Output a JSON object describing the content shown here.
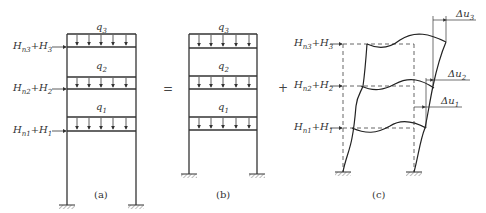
{
  "figure": {
    "panels": [
      {
        "id": "a",
        "caption": "(a)",
        "loads_vertical": [
          "q3",
          "q2",
          "q1"
        ],
        "loads_horizontal": [
          {
            "label": "Hn3+H3",
            "main": "H",
            "sub1": "n3",
            "plus": "+H",
            "sub2": "3"
          },
          {
            "label": "Hn2+H2",
            "main": "H",
            "sub1": "n2",
            "plus": "+H",
            "sub2": "2"
          },
          {
            "label": "Hn1+H1",
            "main": "H",
            "sub1": "n1",
            "plus": "+H",
            "sub2": "1"
          }
        ]
      },
      {
        "id": "b",
        "caption": "(b)",
        "loads_vertical": [
          "q3",
          "q2",
          "q1"
        ]
      },
      {
        "id": "c",
        "caption": "(c)",
        "loads_horizontal": [
          {
            "label": "Hn3+H3",
            "main": "H",
            "sub1": "n3",
            "plus": "+H",
            "sub2": "3"
          },
          {
            "label": "Hn2+H2",
            "main": "H",
            "sub1": "n2",
            "plus": "+H",
            "sub2": "2"
          },
          {
            "label": "Hn1+H1",
            "main": "H",
            "sub1": "n1",
            "plus": "+H",
            "sub2": "1"
          }
        ],
        "displacements": [
          {
            "label": "Δu3",
            "delta": "Δu",
            "sub": "3"
          },
          {
            "label": "Δu2",
            "delta": "Δu",
            "sub": "2"
          },
          {
            "label": "Δu1",
            "delta": "Δu",
            "sub": "1"
          }
        ]
      }
    ],
    "operators": {
      "equals": "=",
      "plus": "+"
    },
    "q_labels": {
      "q3": {
        "base": "q",
        "sub": "3"
      },
      "q2": {
        "base": "q",
        "sub": "2"
      },
      "q1": {
        "base": "q",
        "sub": "1"
      }
    }
  }
}
